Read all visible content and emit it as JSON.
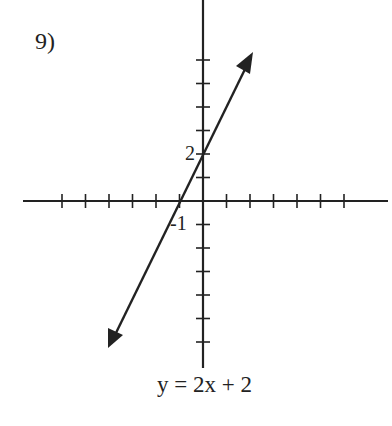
{
  "problem": {
    "number_label": "9)"
  },
  "graph": {
    "equation": "y = 2x + 2",
    "labels": {
      "y_intercept": "2",
      "x_intercept": "-1"
    },
    "line_color": "#222222",
    "origin_px": [
      203,
      201
    ],
    "unit_px": 23.5,
    "x_ticks": [
      -6,
      -5,
      -4,
      -3,
      -2,
      -1,
      1,
      2,
      3,
      4,
      5,
      6
    ],
    "y_ticks": [
      6,
      5,
      4,
      3,
      2,
      1,
      -1,
      -2,
      -3,
      -4,
      -5,
      -6
    ]
  },
  "chart_data": {
    "type": "line",
    "title": "y = 2x + 2",
    "slope": 2,
    "y_intercept": 2,
    "x_intercept": -1,
    "points": [
      {
        "x": -1,
        "y": 0
      },
      {
        "x": 0,
        "y": 2
      }
    ],
    "arrow_endpoints": [
      {
        "x": -4,
        "y": -6.3
      },
      {
        "x": 2.1,
        "y": 6.3
      }
    ],
    "xlim": [
      -7.5,
      7.8
    ],
    "ylim": [
      -7.2,
      8.5
    ],
    "grid": false
  }
}
